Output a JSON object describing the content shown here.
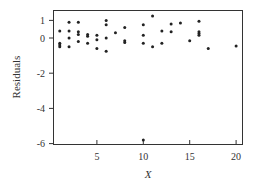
{
  "chart_data": {
    "type": "scatter",
    "title": "",
    "xlabel": "X",
    "ylabel": "Residuals",
    "xlim": [
      0.2,
      20.8
    ],
    "ylim": [
      -6.2,
      1.4
    ],
    "xticks": [
      5,
      10,
      15,
      20
    ],
    "yticks": [
      1,
      0,
      -2,
      -4,
      -6
    ],
    "xtick_labels": [
      "5",
      "10",
      "15",
      "20"
    ],
    "ytick_labels": [
      "1",
      "0",
      "-2",
      "-4",
      "-6"
    ],
    "grid": false,
    "legend": null,
    "points": [
      {
        "x": 1,
        "y": 0.4
      },
      {
        "x": 1,
        "y": -0.3
      },
      {
        "x": 1,
        "y": -0.4
      },
      {
        "x": 1,
        "y": -0.5
      },
      {
        "x": 2,
        "y": 0.9
      },
      {
        "x": 2,
        "y": 0.4
      },
      {
        "x": 2,
        "y": 0.0
      },
      {
        "x": 2,
        "y": -0.5
      },
      {
        "x": 3,
        "y": 0.9
      },
      {
        "x": 3,
        "y": 0.35
      },
      {
        "x": 3,
        "y": 0.2
      },
      {
        "x": 3,
        "y": -0.2
      },
      {
        "x": 4,
        "y": 0.2
      },
      {
        "x": 4,
        "y": 0.1
      },
      {
        "x": 4,
        "y": -0.3
      },
      {
        "x": 5,
        "y": 0.15
      },
      {
        "x": 5,
        "y": -0.1
      },
      {
        "x": 5,
        "y": -0.6
      },
      {
        "x": 6,
        "y": 1.0
      },
      {
        "x": 6,
        "y": 0.75
      },
      {
        "x": 6,
        "y": 0.0
      },
      {
        "x": 6,
        "y": -0.75
      },
      {
        "x": 7,
        "y": 0.3
      },
      {
        "x": 8,
        "y": 0.6
      },
      {
        "x": 8,
        "y": -0.15
      },
      {
        "x": 8,
        "y": -0.25
      },
      {
        "x": 10,
        "y": 0.75
      },
      {
        "x": 10,
        "y": 0.15
      },
      {
        "x": 10,
        "y": -0.3
      },
      {
        "x": 10,
        "y": -5.8
      },
      {
        "x": 11,
        "y": 1.25
      },
      {
        "x": 11,
        "y": -0.5
      },
      {
        "x": 12,
        "y": 0.4
      },
      {
        "x": 12,
        "y": -0.3
      },
      {
        "x": 13,
        "y": 0.8
      },
      {
        "x": 13,
        "y": 0.35
      },
      {
        "x": 14,
        "y": 0.85
      },
      {
        "x": 15,
        "y": -0.15
      },
      {
        "x": 16,
        "y": 0.95
      },
      {
        "x": 16,
        "y": 0.35
      },
      {
        "x": 16,
        "y": 0.25
      },
      {
        "x": 16,
        "y": 0.15
      },
      {
        "x": 17,
        "y": -0.6
      },
      {
        "x": 20,
        "y": -0.45
      }
    ]
  },
  "axis": {
    "x_label": "X",
    "y_label": "Residuals",
    "x_ticks": [
      "5",
      "10",
      "15",
      "20"
    ],
    "y_ticks": [
      "1",
      "0",
      "-2",
      "-4",
      "-6"
    ]
  }
}
